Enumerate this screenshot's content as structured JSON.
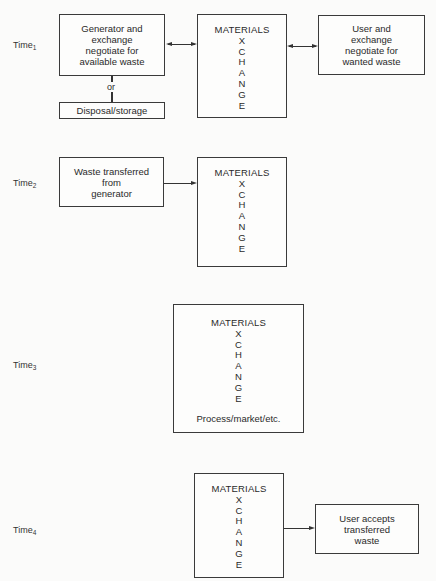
{
  "diagram": {
    "rows": [
      {
        "time_label": "Time",
        "time_sub": "1",
        "left_box": [
          "Generator and",
          "exchange",
          "negotiate for",
          "available waste"
        ],
        "left_connector": "bidirectional",
        "or_label": "or",
        "alt_box": "Disposal/storage",
        "exchange": {
          "title": "MATERIALS",
          "letters": [
            "X",
            "C",
            "H",
            "A",
            "N",
            "G",
            "E"
          ]
        },
        "right_connector": "bidirectional",
        "right_box": [
          "User and",
          "exchange",
          "negotiate for",
          "wanted waste"
        ]
      },
      {
        "time_label": "Time",
        "time_sub": "2",
        "left_box": [
          "Waste transferred",
          "from",
          "generator"
        ],
        "left_connector": "arrow-right",
        "exchange": {
          "title": "MATERIALS",
          "letters": [
            "X",
            "C",
            "H",
            "A",
            "N",
            "G",
            "E"
          ]
        }
      },
      {
        "time_label": "Time",
        "time_sub": "3",
        "exchange": {
          "title": "MATERIALS",
          "letters": [
            "X",
            "C",
            "H",
            "A",
            "N",
            "G",
            "E"
          ],
          "note": "Process/market/etc."
        }
      },
      {
        "time_label": "Time",
        "time_sub": "4",
        "exchange": {
          "title": "MATERIALS",
          "letters": [
            "X",
            "C",
            "H",
            "A",
            "N",
            "G",
            "E"
          ]
        },
        "right_connector": "arrow-right",
        "right_box": [
          "User accepts",
          "transferred",
          "waste"
        ]
      }
    ]
  }
}
